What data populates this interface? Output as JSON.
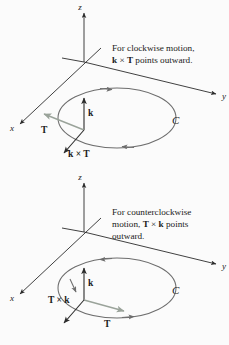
{
  "figure": {
    "background_color": "#fbfbfb",
    "axis_color": "#2b2b2b",
    "curve_color": "#6d6d6d",
    "vector_color": "#1a1a1a",
    "tangent_color": "#9aa39a",
    "text_color": "#1a1a1a",
    "cross_symbol": "×"
  },
  "panels": [
    {
      "id": "clockwise-panel",
      "caption_lines": [
        {
          "segments": [
            {
              "text": "For clockwise motion,",
              "bold": false
            }
          ]
        },
        {
          "segments": [
            {
              "text": "k",
              "bold": true
            },
            {
              "text": " × ",
              "bold": false
            },
            {
              "text": "T",
              "bold": true
            },
            {
              "text": " points outward.",
              "bold": false
            }
          ]
        }
      ],
      "axes": [
        {
          "name": "z-axis",
          "label": "z"
        },
        {
          "name": "y-axis",
          "label": "y"
        },
        {
          "name": "x-axis",
          "label": "x"
        }
      ],
      "curve_label": "C",
      "orientation": "clockwise",
      "vectors": [
        {
          "name": "k-vector",
          "label_segments": [
            {
              "text": "k",
              "bold": true
            }
          ]
        },
        {
          "name": "tangent-vector",
          "label_segments": [
            {
              "text": "T",
              "bold": true
            }
          ]
        },
        {
          "name": "k-cross-t-vector",
          "label_segments": [
            {
              "text": "k",
              "bold": true
            },
            {
              "text": " × ",
              "bold": false
            },
            {
              "text": "T",
              "bold": true
            }
          ]
        }
      ]
    },
    {
      "id": "counterclockwise-panel",
      "caption_lines": [
        {
          "segments": [
            {
              "text": "For counterclockwise",
              "bold": false
            }
          ]
        },
        {
          "segments": [
            {
              "text": "motion, ",
              "bold": false
            },
            {
              "text": "T",
              "bold": true
            },
            {
              "text": " × ",
              "bold": false
            },
            {
              "text": "k",
              "bold": true
            },
            {
              "text": " points",
              "bold": false
            }
          ]
        },
        {
          "segments": [
            {
              "text": "outward.",
              "bold": false
            }
          ]
        }
      ],
      "axes": [
        {
          "name": "z-axis",
          "label": "z"
        },
        {
          "name": "y-axis",
          "label": "y"
        },
        {
          "name": "x-axis",
          "label": "x"
        }
      ],
      "curve_label": "C",
      "orientation": "counterclockwise",
      "vectors": [
        {
          "name": "k-vector",
          "label_segments": [
            {
              "text": "k",
              "bold": true
            }
          ]
        },
        {
          "name": "tangent-vector",
          "label_segments": [
            {
              "text": "T",
              "bold": true
            }
          ]
        },
        {
          "name": "t-cross-k-vector",
          "label_segments": [
            {
              "text": "T",
              "bold": true
            },
            {
              "text": " × ",
              "bold": false
            },
            {
              "text": "k",
              "bold": true
            }
          ]
        }
      ]
    }
  ]
}
